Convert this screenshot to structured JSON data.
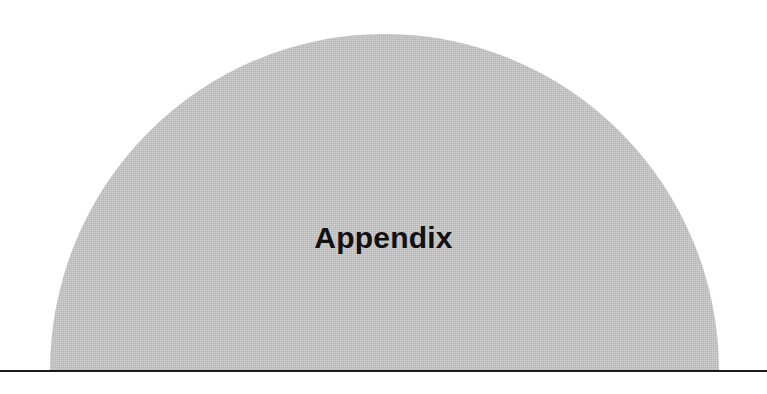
{
  "section": {
    "title": "Appendix"
  },
  "colors": {
    "dome_fill": "#c8c8c8",
    "title_text": "#111111",
    "rule": "#1a1a1a",
    "background": "#ffffff"
  }
}
